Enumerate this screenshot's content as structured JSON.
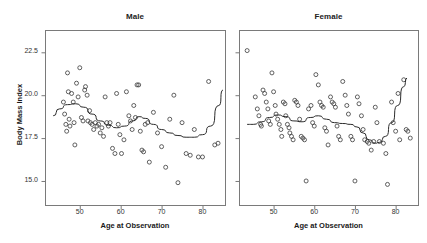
{
  "figure": {
    "y_axis_title": "Body Mass Index",
    "panels": [
      {
        "title": "Male",
        "x_axis_title": "Age at Observation"
      },
      {
        "title": "Female",
        "x_axis_title": "Age at Observation"
      }
    ],
    "y_ticks": [
      "22.5",
      "20.0",
      "17.5",
      "15.0"
    ],
    "x_ticks": [
      "50",
      "60",
      "70",
      "80"
    ],
    "colors": {
      "point_stroke": "#3a3a3a",
      "curve": "#2b2b2b",
      "frame": "#7a7a7a",
      "background": "#ffffff",
      "text": "#1a1a1a"
    }
  },
  "chart_data": {
    "type": "scatter",
    "title": "",
    "xlabel": "Age at Observation",
    "ylabel": "Body Mass Index",
    "xlim": [
      41.5,
      85.5
    ],
    "ylim": [
      13.6,
      23.8
    ],
    "xticks": [
      50,
      60,
      70,
      80
    ],
    "yticks": [
      22.5,
      20.0,
      17.5,
      15.0
    ],
    "grid": false,
    "legend": "none",
    "marker": "open-circle",
    "panels": [
      {
        "name": "Male",
        "points": [
          [
            46.0,
            19.6
          ],
          [
            46.3,
            18.9
          ],
          [
            46.6,
            18.3
          ],
          [
            46.8,
            17.9
          ],
          [
            47.0,
            21.3
          ],
          [
            47.2,
            20.2
          ],
          [
            47.4,
            18.6
          ],
          [
            47.6,
            18.2
          ],
          [
            48.0,
            20.1
          ],
          [
            48.4,
            19.6
          ],
          [
            48.6,
            18.4
          ],
          [
            48.8,
            17.1
          ],
          [
            49.2,
            20.7
          ],
          [
            49.6,
            19.9
          ],
          [
            50.0,
            21.6
          ],
          [
            50.4,
            18.7
          ],
          [
            50.8,
            18.5
          ],
          [
            51.2,
            20.3
          ],
          [
            51.4,
            20.5
          ],
          [
            51.8,
            20.0
          ],
          [
            52.0,
            18.5
          ],
          [
            52.4,
            19.1
          ],
          [
            52.6,
            18.4
          ],
          [
            53.0,
            18.3
          ],
          [
            53.4,
            18.0
          ],
          [
            53.8,
            18.4
          ],
          [
            54.2,
            18.2
          ],
          [
            54.6,
            18.3
          ],
          [
            55.0,
            17.8
          ],
          [
            55.4,
            18.1
          ],
          [
            55.8,
            17.6
          ],
          [
            56.2,
            19.9
          ],
          [
            56.6,
            18.4
          ],
          [
            57.0,
            18.2
          ],
          [
            57.4,
            18.4
          ],
          [
            58.0,
            16.9
          ],
          [
            58.6,
            16.6
          ],
          [
            59.0,
            20.1
          ],
          [
            59.4,
            18.3
          ],
          [
            59.8,
            17.7
          ],
          [
            60.2,
            16.6
          ],
          [
            60.8,
            17.4
          ],
          [
            61.4,
            20.2
          ],
          [
            62.0,
            18.8
          ],
          [
            62.4,
            18.5
          ],
          [
            62.8,
            18.0
          ],
          [
            63.2,
            19.4
          ],
          [
            63.6,
            18.7
          ],
          [
            64.0,
            20.6
          ],
          [
            64.4,
            20.6
          ],
          [
            64.8,
            17.9
          ],
          [
            65.2,
            16.8
          ],
          [
            65.6,
            16.7
          ],
          [
            66.0,
            18.3
          ],
          [
            66.6,
            18.4
          ],
          [
            67.0,
            16.1
          ],
          [
            68.0,
            19.0
          ],
          [
            69.0,
            17.8
          ],
          [
            70.0,
            17.0
          ],
          [
            71.0,
            15.8
          ],
          [
            72.0,
            18.6
          ],
          [
            73.0,
            20.0
          ],
          [
            74.0,
            14.9
          ],
          [
            75.0,
            18.4
          ],
          [
            76.0,
            16.6
          ],
          [
            77.0,
            16.5
          ],
          [
            78.0,
            18.0
          ],
          [
            79.0,
            16.4
          ],
          [
            80.0,
            16.4
          ],
          [
            81.5,
            20.8
          ],
          [
            83.0,
            17.1
          ],
          [
            83.8,
            17.2
          ]
        ],
        "fit_curve": [
          [
            43.5,
            18.8
          ],
          [
            45.0,
            19.2
          ],
          [
            47.0,
            19.45
          ],
          [
            49.0,
            19.5
          ],
          [
            51.0,
            19.3
          ],
          [
            53.0,
            18.9
          ],
          [
            55.0,
            18.5
          ],
          [
            57.0,
            18.25
          ],
          [
            59.0,
            18.1
          ],
          [
            61.0,
            18.2
          ],
          [
            63.0,
            18.5
          ],
          [
            64.5,
            18.75
          ],
          [
            66.0,
            18.65
          ],
          [
            68.0,
            18.3
          ],
          [
            70.0,
            18.0
          ],
          [
            72.0,
            17.8
          ],
          [
            74.0,
            17.65
          ],
          [
            76.0,
            17.55
          ],
          [
            78.0,
            17.55
          ],
          [
            80.0,
            17.7
          ],
          [
            82.0,
            18.2
          ],
          [
            84.0,
            19.4
          ],
          [
            85.0,
            20.3
          ]
        ]
      },
      {
        "name": "Female",
        "points": [
          [
            43.5,
            22.6
          ],
          [
            45.5,
            19.9
          ],
          [
            46.0,
            19.2
          ],
          [
            46.4,
            18.8
          ],
          [
            46.8,
            18.3
          ],
          [
            47.0,
            18.2
          ],
          [
            47.4,
            20.3
          ],
          [
            47.8,
            20.1
          ],
          [
            48.2,
            19.6
          ],
          [
            48.6,
            19.2
          ],
          [
            48.8,
            18.5
          ],
          [
            49.2,
            18.3
          ],
          [
            49.6,
            21.3
          ],
          [
            50.0,
            20.2
          ],
          [
            50.4,
            19.4
          ],
          [
            50.6,
            18.9
          ],
          [
            51.0,
            18.6
          ],
          [
            51.4,
            18.3
          ],
          [
            51.8,
            18.0
          ],
          [
            52.0,
            17.6
          ],
          [
            52.4,
            19.6
          ],
          [
            52.8,
            19.5
          ],
          [
            53.0,
            18.8
          ],
          [
            53.4,
            18.3
          ],
          [
            53.8,
            18.1
          ],
          [
            54.0,
            17.8
          ],
          [
            54.4,
            17.6
          ],
          [
            54.8,
            17.4
          ],
          [
            55.2,
            19.7
          ],
          [
            55.6,
            19.6
          ],
          [
            56.0,
            19.4
          ],
          [
            56.4,
            18.6
          ],
          [
            56.8,
            17.6
          ],
          [
            57.2,
            17.5
          ],
          [
            57.6,
            17.4
          ],
          [
            58.0,
            15.0
          ],
          [
            58.6,
            19.2
          ],
          [
            59.2,
            19.4
          ],
          [
            59.6,
            18.4
          ],
          [
            60.0,
            18.2
          ],
          [
            60.4,
            21.2
          ],
          [
            61.0,
            20.6
          ],
          [
            61.4,
            19.6
          ],
          [
            61.8,
            19.4
          ],
          [
            62.2,
            19.3
          ],
          [
            62.6,
            18.1
          ],
          [
            63.0,
            17.9
          ],
          [
            63.4,
            17.1
          ],
          [
            64.0,
            19.9
          ],
          [
            64.4,
            19.6
          ],
          [
            64.8,
            19.5
          ],
          [
            65.2,
            19.3
          ],
          [
            65.6,
            18.2
          ],
          [
            66.0,
            17.6
          ],
          [
            66.4,
            17.4
          ],
          [
            67.0,
            20.8
          ],
          [
            67.6,
            20.0
          ],
          [
            68.0,
            19.4
          ],
          [
            68.4,
            18.9
          ],
          [
            69.0,
            17.6
          ],
          [
            69.4,
            17.4
          ],
          [
            70.0,
            15.0
          ],
          [
            70.6,
            19.9
          ],
          [
            71.0,
            19.5
          ],
          [
            71.6,
            18.8
          ],
          [
            72.0,
            18.0
          ],
          [
            72.4,
            17.4
          ],
          [
            73.0,
            17.3
          ],
          [
            73.4,
            17.2
          ],
          [
            74.0,
            16.8
          ],
          [
            74.6,
            17.3
          ],
          [
            75.0,
            19.3
          ],
          [
            75.4,
            18.4
          ],
          [
            76.0,
            17.3
          ],
          [
            77.0,
            17.2
          ],
          [
            77.6,
            16.6
          ],
          [
            78.0,
            14.8
          ],
          [
            79.0,
            19.6
          ],
          [
            79.4,
            18.4
          ],
          [
            80.0,
            17.9
          ],
          [
            80.6,
            20.1
          ],
          [
            81.0,
            17.4
          ],
          [
            82.0,
            20.9
          ],
          [
            82.6,
            18.0
          ],
          [
            83.0,
            17.9
          ],
          [
            83.6,
            17.5
          ]
        ],
        "fit_curve": [
          [
            43.5,
            18.3
          ],
          [
            45.0,
            18.3
          ],
          [
            47.0,
            18.45
          ],
          [
            49.0,
            18.7
          ],
          [
            51.0,
            18.85
          ],
          [
            53.0,
            18.75
          ],
          [
            55.0,
            18.5
          ],
          [
            57.0,
            18.45
          ],
          [
            59.0,
            18.7
          ],
          [
            61.0,
            18.8
          ],
          [
            63.0,
            18.6
          ],
          [
            65.0,
            18.4
          ],
          [
            67.0,
            18.35
          ],
          [
            69.0,
            18.3
          ],
          [
            70.5,
            18.15
          ],
          [
            72.0,
            17.8
          ],
          [
            73.5,
            17.4
          ],
          [
            75.0,
            17.2
          ],
          [
            76.0,
            17.25
          ],
          [
            77.5,
            17.6
          ],
          [
            79.0,
            18.4
          ],
          [
            80.5,
            19.4
          ],
          [
            82.0,
            20.5
          ],
          [
            82.8,
            21.0
          ]
        ]
      }
    ]
  }
}
